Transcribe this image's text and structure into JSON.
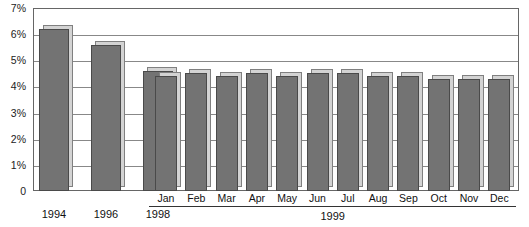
{
  "chart_data": {
    "type": "bar",
    "title": "",
    "subtitle": "",
    "xlabel": "",
    "ylabel": "",
    "ylim": [
      0,
      7
    ],
    "grid": true,
    "legend": null,
    "y_ticks": [
      {
        "label": "7%",
        "value": 7
      },
      {
        "label": "6%",
        "value": 6
      },
      {
        "label": "5%",
        "value": 5
      },
      {
        "label": "4%",
        "value": 4
      },
      {
        "label": "3%",
        "value": 3
      },
      {
        "label": "2%",
        "value": 2
      },
      {
        "label": "1%",
        "value": 1
      },
      {
        "label": "0",
        "value": 0
      }
    ],
    "categories": [
      "1994",
      "1996",
      "1998",
      "Jan",
      "Feb",
      "Mar",
      "Apr",
      "May",
      "Jun",
      "Jul",
      "Aug",
      "Sep",
      "Oct",
      "Nov",
      "Dec"
    ],
    "values": [
      6.2,
      5.6,
      4.6,
      4.4,
      4.5,
      4.4,
      4.5,
      4.4,
      4.5,
      4.5,
      4.4,
      4.4,
      4.3,
      4.3,
      4.3
    ],
    "units": "%",
    "group_label": "1999",
    "group_members": [
      "Jan",
      "Feb",
      "Mar",
      "Apr",
      "May",
      "Jun",
      "Jul",
      "Aug",
      "Sep",
      "Oct",
      "Nov",
      "Dec"
    ],
    "bar_color": "#737373",
    "bar_shadow_color": "#d3d3d3",
    "grid_color": "#888888",
    "frame_color": "#666666"
  }
}
